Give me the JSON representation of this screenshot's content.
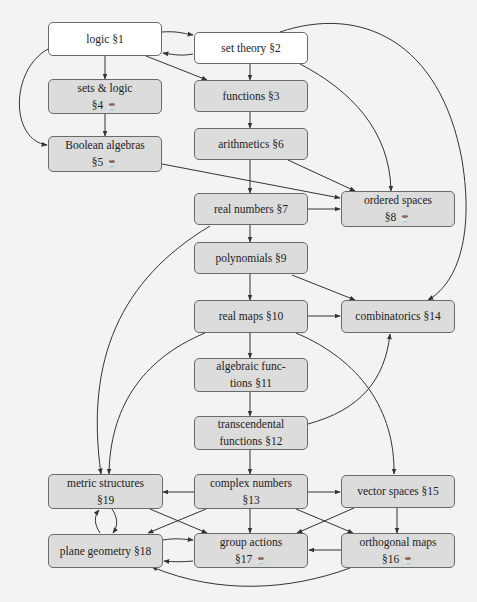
{
  "colors": {
    "background": "#f3f3f3",
    "node_plain": "#ffffff",
    "node_shaded": "#dcdcdc",
    "border": "#6a6a6a",
    "edge": "#333333"
  },
  "icons": {
    "coffee": "☕"
  },
  "nodes": {
    "n1": {
      "line1": "logic §1",
      "line2": "",
      "style": "white",
      "coffee": false
    },
    "n2": {
      "line1": "set theory §2",
      "line2": "",
      "style": "white",
      "coffee": false
    },
    "n3": {
      "line1": "functions §3",
      "line2": "",
      "style": "grey",
      "coffee": false
    },
    "n4": {
      "line1": "sets & logic",
      "line2": "§4",
      "style": "grey",
      "coffee": true
    },
    "n5": {
      "line1": "Boolean algebras",
      "line2": "§5",
      "style": "grey",
      "coffee": true
    },
    "n6": {
      "line1": "arithmetics §6",
      "line2": "",
      "style": "grey",
      "coffee": false
    },
    "n7": {
      "line1": "real numbers §7",
      "line2": "",
      "style": "grey",
      "coffee": false
    },
    "n8": {
      "line1": "ordered spaces",
      "line2": "§8",
      "style": "grey",
      "coffee": true
    },
    "n9": {
      "line1": "polynomials §9",
      "line2": "",
      "style": "grey",
      "coffee": false
    },
    "n10": {
      "line1": "real maps §10",
      "line2": "",
      "style": "grey",
      "coffee": false
    },
    "n11": {
      "line1": "algebraic func-",
      "line2": "tions §11",
      "style": "grey",
      "coffee": false
    },
    "n12": {
      "line1": "transcendental",
      "line2": "functions §12",
      "style": "grey",
      "coffee": false
    },
    "n13": {
      "line1": "complex numbers",
      "line2": "§13",
      "style": "grey",
      "coffee": false
    },
    "n14": {
      "line1": "combinatorics §14",
      "line2": "",
      "style": "grey",
      "coffee": false
    },
    "n15": {
      "line1": "vector spaces §15",
      "line2": "",
      "style": "grey",
      "coffee": false
    },
    "n16": {
      "line1": "orthogonal maps",
      "line2": "§16",
      "style": "grey",
      "coffee": true
    },
    "n17": {
      "line1": "group actions",
      "line2": "§17",
      "style": "grey",
      "coffee": true
    },
    "n18": {
      "line1": "plane geometry §18",
      "line2": "",
      "style": "grey",
      "coffee": false
    },
    "n19": {
      "line1": "metric structures",
      "line2": "§19",
      "style": "grey",
      "coffee": false
    }
  },
  "edges": [
    [
      "n1",
      "n2"
    ],
    [
      "n2",
      "n1"
    ],
    [
      "n1",
      "n3"
    ],
    [
      "n1",
      "n4"
    ],
    [
      "n1",
      "n5"
    ],
    [
      "n4",
      "n5"
    ],
    [
      "n2",
      "n3"
    ],
    [
      "n2",
      "n8"
    ],
    [
      "n2",
      "n14"
    ],
    [
      "n3",
      "n6"
    ],
    [
      "n6",
      "n7"
    ],
    [
      "n6",
      "n8"
    ],
    [
      "n5",
      "n8"
    ],
    [
      "n7",
      "n8"
    ],
    [
      "n7",
      "n9"
    ],
    [
      "n7",
      "n19"
    ],
    [
      "n9",
      "n10"
    ],
    [
      "n9",
      "n14"
    ],
    [
      "n10",
      "n14"
    ],
    [
      "n10",
      "n11"
    ],
    [
      "n10",
      "n19"
    ],
    [
      "n10",
      "n15"
    ],
    [
      "n11",
      "n12"
    ],
    [
      "n12",
      "n14"
    ],
    [
      "n12",
      "n13"
    ],
    [
      "n13",
      "n19"
    ],
    [
      "n13",
      "n15"
    ],
    [
      "n13",
      "n17"
    ],
    [
      "n13",
      "n18"
    ],
    [
      "n13",
      "n16"
    ],
    [
      "n15",
      "n16"
    ],
    [
      "n15",
      "n17"
    ],
    [
      "n16",
      "n17"
    ],
    [
      "n16",
      "n18"
    ],
    [
      "n19",
      "n17"
    ],
    [
      "n19",
      "n18"
    ],
    [
      "n18",
      "n19"
    ],
    [
      "n18",
      "n17"
    ],
    [
      "n17",
      "n18"
    ]
  ]
}
